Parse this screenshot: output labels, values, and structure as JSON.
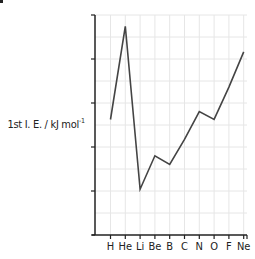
{
  "chart_data": {
    "type": "line",
    "title": "",
    "xlabel": "",
    "ylabel": "1st I. E. / kJ mol⁻¹",
    "ylabel_main": "1st I. E. / kJ mol",
    "ylabel_sup": "-1",
    "categories": [
      "H",
      "He",
      "Li",
      "Be",
      "B",
      "C",
      "N",
      "O",
      "F",
      "Ne"
    ],
    "series": [
      {
        "name": "First ionisation energy",
        "values": [
          1312,
          2372,
          520,
          900,
          801,
          1086,
          1402,
          1314,
          1681,
          2081
        ]
      }
    ],
    "ylim": [
      0,
      2500
    ],
    "yticks_labeled": false,
    "grid": true,
    "legend": null
  },
  "colors": {
    "line": "#444444",
    "axis": "#222222",
    "grid": "#e6e6e6"
  }
}
